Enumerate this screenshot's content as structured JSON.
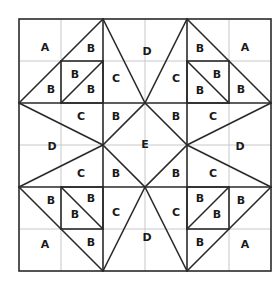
{
  "diagram": {
    "type": "quilt-block-pattern",
    "grid": {
      "cells": 6,
      "origin_x": 19,
      "origin_y": 19,
      "cell_size": 42
    },
    "colors": {
      "grid": "#c8c8c8",
      "lines": "#2a2a2a",
      "text": "#1a1a1a",
      "background": "#ffffff"
    },
    "labels": [
      {
        "text": "A",
        "x": 45,
        "y": 47
      },
      {
        "text": "B",
        "x": 91,
        "y": 48
      },
      {
        "text": "B",
        "x": 51,
        "y": 89
      },
      {
        "text": "B",
        "x": 75,
        "y": 74
      },
      {
        "text": "B",
        "x": 91,
        "y": 89
      },
      {
        "text": "C",
        "x": 116,
        "y": 78
      },
      {
        "text": "D",
        "x": 147,
        "y": 51
      },
      {
        "text": "C",
        "x": 176,
        "y": 78
      },
      {
        "text": "B",
        "x": 200,
        "y": 48
      },
      {
        "text": "A",
        "x": 245,
        "y": 47
      },
      {
        "text": "B",
        "x": 217,
        "y": 74
      },
      {
        "text": "B",
        "x": 200,
        "y": 90
      },
      {
        "text": "B",
        "x": 241,
        "y": 89
      },
      {
        "text": "C",
        "x": 81,
        "y": 116
      },
      {
        "text": "B",
        "x": 116,
        "y": 116
      },
      {
        "text": "B",
        "x": 176,
        "y": 116
      },
      {
        "text": "C",
        "x": 213,
        "y": 116
      },
      {
        "text": "D",
        "x": 52,
        "y": 146
      },
      {
        "text": "E",
        "x": 145,
        "y": 144
      },
      {
        "text": "D",
        "x": 240,
        "y": 146
      },
      {
        "text": "C",
        "x": 81,
        "y": 173
      },
      {
        "text": "B",
        "x": 116,
        "y": 173
      },
      {
        "text": "B",
        "x": 176,
        "y": 173
      },
      {
        "text": "C",
        "x": 213,
        "y": 173
      },
      {
        "text": "B",
        "x": 51,
        "y": 200
      },
      {
        "text": "B",
        "x": 91,
        "y": 198
      },
      {
        "text": "B",
        "x": 75,
        "y": 214
      },
      {
        "text": "C",
        "x": 116,
        "y": 212
      },
      {
        "text": "C",
        "x": 176,
        "y": 212
      },
      {
        "text": "B",
        "x": 200,
        "y": 198
      },
      {
        "text": "B",
        "x": 217,
        "y": 214
      },
      {
        "text": "B",
        "x": 241,
        "y": 200
      },
      {
        "text": "A",
        "x": 45,
        "y": 244
      },
      {
        "text": "B",
        "x": 91,
        "y": 242
      },
      {
        "text": "D",
        "x": 147,
        "y": 237
      },
      {
        "text": "B",
        "x": 200,
        "y": 242
      },
      {
        "text": "A",
        "x": 245,
        "y": 244
      }
    ]
  }
}
